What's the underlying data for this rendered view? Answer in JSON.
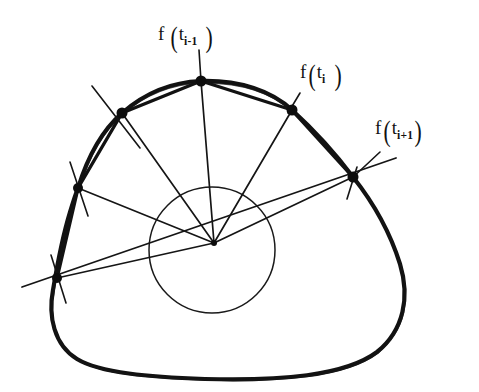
{
  "figure": {
    "kind": "hand-drawn-geometry-diagram",
    "background_color": "#ffffff",
    "ink_color": "#111111",
    "labels": [
      {
        "id": "label-f-t-i-minus-1",
        "text": "f ( t i-1 )",
        "f": "f",
        "open_paren": "(",
        "t": "t",
        "subscript": "i-1",
        "close_paren": ")",
        "x": 158,
        "y": 24
      },
      {
        "id": "label-f-t-i",
        "text": "f ( t i )",
        "f": "f",
        "open_paren": "(",
        "t": "t",
        "subscript": "i",
        "close_paren": ")",
        "x": 300,
        "y": 62
      },
      {
        "id": "label-f-t-i-plus-1",
        "text": "f ( t i+1 )",
        "f": "f",
        "open_paren": "(",
        "t": "t",
        "subscript": "i+1",
        "close_paren": ")",
        "x": 375,
        "y": 118
      }
    ],
    "pole": {
      "x": 214,
      "y": 243
    },
    "inner_circle": {
      "cx": 212,
      "cy": 250,
      "r": 63
    },
    "curve_points": [
      {
        "name": "point-bottom-left",
        "x": 57,
        "y": 278
      },
      {
        "name": "point-left",
        "x": 78,
        "y": 188
      },
      {
        "name": "point-upper-left",
        "x": 122,
        "y": 113
      },
      {
        "name": "point-f-t-i-minus-1",
        "x": 201,
        "y": 81
      },
      {
        "name": "point-f-t-i",
        "x": 292,
        "y": 110
      },
      {
        "name": "point-f-t-i-plus-1",
        "x": 353,
        "y": 177
      }
    ],
    "leader_lines": [
      {
        "name": "leader-to-f-t-i-minus-1",
        "x1": 199,
        "y1": 50,
        "x2": 201,
        "y2": 81
      },
      {
        "name": "leader-to-f-t-i",
        "x1": 296,
        "y1": 96,
        "x2": 292,
        "y2": 110
      },
      {
        "name": "leader-to-f-t-i-plus-1",
        "x1": 369,
        "y1": 160,
        "x2": 353,
        "y2": 177
      }
    ],
    "transversal": {
      "x1": 22,
      "y1": 287,
      "x2": 396,
      "y2": 158
    }
  }
}
